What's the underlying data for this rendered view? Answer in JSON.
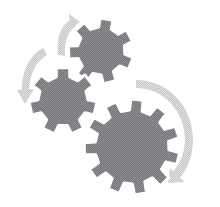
{
  "image": {
    "title": "Three interlocking gears with rotation arrows",
    "width": 220,
    "height": 207,
    "background_color": "#ffffff",
    "alt_text": "Three gray cogwheels of different sizes arranged diagonally with three light gray curved motion arrows indicating rotation"
  },
  "palette": {
    "gear_fill": "#76767a",
    "gear_fill_light": "#8d8d91",
    "gear_outline": "#ffffff",
    "arrow_fill": "#c9c9cb",
    "arrow_fill_light": "#dcdcde",
    "background": "#ffffff"
  },
  "gears": [
    {
      "name": "top-gear",
      "label": "Top gear",
      "center_x": 101,
      "center_y": 51,
      "outer_radius": 33,
      "root_radius": 24,
      "hub_radius": 0,
      "teeth": 7,
      "rotation_deg": 10,
      "fill": "#76767a"
    },
    {
      "name": "middle-gear",
      "label": "Middle gear",
      "center_x": 63,
      "center_y": 101,
      "outer_radius": 34,
      "root_radius": 25,
      "hub_radius": 0,
      "teeth": 7,
      "rotation_deg": 0,
      "fill": "#76767a"
    },
    {
      "name": "large-gear",
      "label": "Large gear",
      "center_x": 132,
      "center_y": 147,
      "outer_radius": 48,
      "root_radius": 37,
      "hub_radius": 0,
      "teeth": 11,
      "rotation_deg": 6,
      "fill": "#76767a"
    }
  ],
  "arrows": [
    {
      "name": "top-arrow",
      "label": "Top rotation arrow",
      "direction": "counter-clockwise",
      "fill": "#c9c9cb"
    },
    {
      "name": "left-arrow",
      "label": "Left rotation arrow",
      "direction": "counter-clockwise",
      "fill": "#c9c9cb"
    },
    {
      "name": "right-arrow",
      "label": "Right rotation arrow",
      "direction": "clockwise",
      "fill": "#c9c9cb"
    }
  ]
}
